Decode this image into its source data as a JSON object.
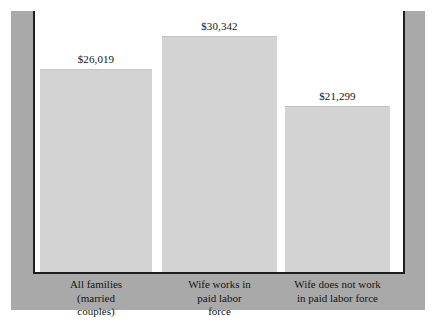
{
  "chart_data": {
    "type": "bar",
    "title": "",
    "xlabel": "",
    "ylabel": "",
    "ylim": [
      0,
      30342
    ],
    "grid": false,
    "legend": "none",
    "categories": [
      "All families (married couples)",
      "Wife works in paid labor force",
      "Wife does not work in paid labor force"
    ],
    "category_lines": [
      [
        "All families",
        "(married",
        "couples)"
      ],
      [
        "Wife works in",
        "paid labor",
        "force"
      ],
      [
        "Wife does not work",
        "in paid labor force"
      ]
    ],
    "values": [
      26019,
      30342,
      21299
    ],
    "value_labels": [
      "$26,019",
      "$30,342",
      "$21,299"
    ]
  },
  "style": {
    "bar_fill": "#d3d3d3",
    "frame_band": "#a9a9a9",
    "axis_line": "#1d1d1d",
    "text_color": "#141414",
    "background": "#ffffff"
  }
}
